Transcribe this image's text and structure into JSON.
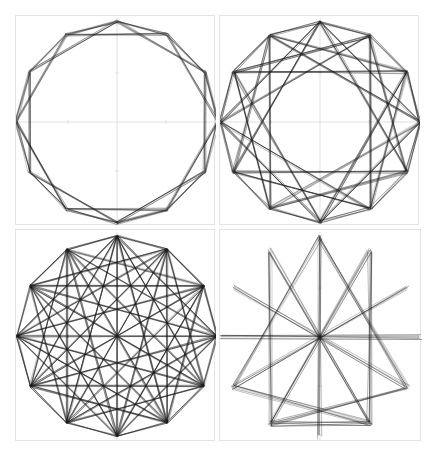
{
  "figure": {
    "line_color": "#1a1a1a",
    "axis_color": "#d8d8d8",
    "border_color": "#e4e4e4",
    "vertex_count": 12,
    "panels": [
      {
        "id": "top-left",
        "label": "Dodecagon with {12/1} and {12/2} chords",
        "box": [
          15,
          15,
          200,
          210
        ],
        "center": [
          116,
          121
        ],
        "radius": 101,
        "rotation_deg": 0,
        "chord_steps": [
          1,
          2
        ],
        "jitter": 3
      },
      {
        "id": "top-right",
        "label": "Dodecagon with {12/1}, {12/3} and {12/4} chords",
        "box": [
          219,
          15,
          200,
          210
        ],
        "center": [
          319,
          121
        ],
        "radius": 100,
        "rotation_deg": 0,
        "chord_steps": [
          1,
          3,
          4
        ],
        "jitter": 3
      },
      {
        "id": "bottom-left",
        "label": "Dodecagon with {12/1}, {12/3}, {12/4}, {12/5} and diameters",
        "box": [
          15,
          229,
          200,
          212
        ],
        "center": [
          116,
          335
        ],
        "radius": 100,
        "rotation_deg": 0,
        "chord_steps": [
          1,
          3,
          4,
          5,
          6
        ],
        "jitter": 2
      },
      {
        "id": "bottom-right",
        "label": "Twelve diameters (spokes) with selected chords",
        "box": [
          219,
          229,
          202,
          212
        ],
        "center": [
          319,
          336
        ],
        "radius": 100,
        "rotation_deg": 0,
        "chord_steps": [
          6
        ],
        "extra_chords": [
          [
            0,
            4
          ],
          [
            0,
            8
          ],
          [
            11,
            7
          ],
          [
            1,
            5
          ],
          [
            8,
            5
          ],
          [
            4,
            7
          ],
          [
            5,
            7
          ]
        ],
        "jitter": 5
      }
    ]
  }
}
